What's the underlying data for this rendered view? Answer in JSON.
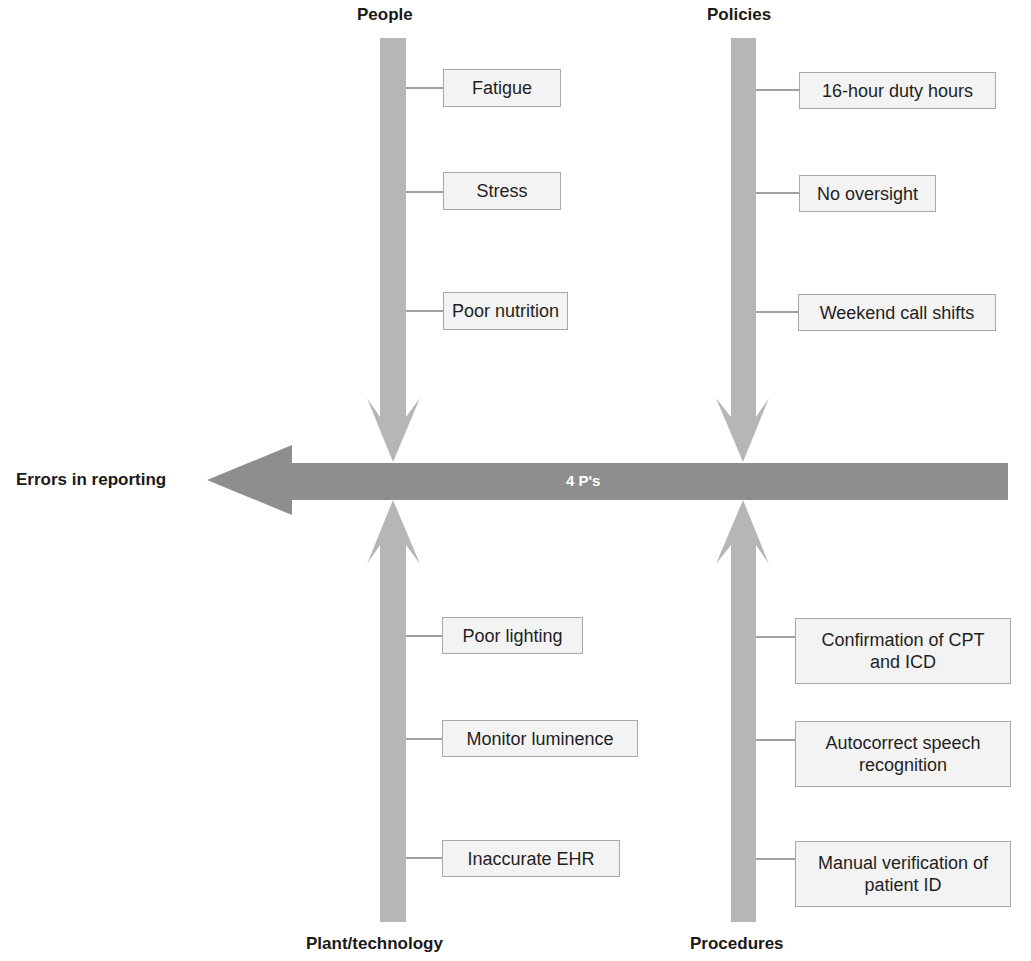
{
  "diagram": {
    "type": "fishbone",
    "effect": "Errors in reporting",
    "spine_label": "4 P's",
    "colors": {
      "spine": "#8e8e8e",
      "bone": "#b6b6b6",
      "box_fill": "#f3f3f3",
      "box_border": "#a8a8a8"
    },
    "categories": [
      {
        "name": "People",
        "causes": [
          "Fatigue",
          "Stress",
          "Poor nutrition"
        ]
      },
      {
        "name": "Policies",
        "causes": [
          "16-hour duty hours",
          "No oversight",
          "Weekend call shifts"
        ]
      },
      {
        "name": "Plant/technology",
        "causes": [
          "Poor lighting",
          "Monitor luminence",
          "Inaccurate EHR"
        ]
      },
      {
        "name": "Procedures",
        "causes": [
          "Confirmation of CPT and ICD",
          "Autocorrect speech recognition",
          "Manual verification of patient ID"
        ]
      }
    ]
  }
}
